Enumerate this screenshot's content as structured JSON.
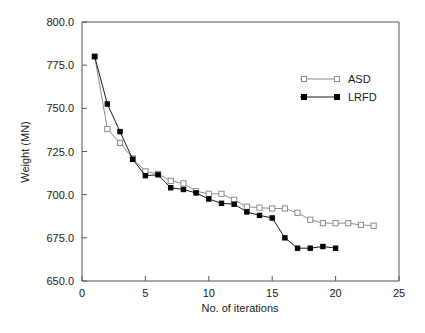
{
  "chart_data": {
    "type": "line",
    "title": "",
    "xlabel": "No. of iterations",
    "ylabel": "Weight (MN)",
    "xlim": [
      0,
      25
    ],
    "ylim": [
      650.0,
      800.0
    ],
    "xticks": [
      "0",
      "5",
      "10",
      "15",
      "20",
      "25"
    ],
    "xtick_values": [
      0,
      5,
      10,
      15,
      20,
      25
    ],
    "yticks": [
      "650.0",
      "675.0",
      "700.0",
      "725.0",
      "750.0",
      "775.0",
      "800.0"
    ],
    "ytick_values": [
      650.0,
      675.0,
      700.0,
      725.0,
      750.0,
      775.0,
      800.0
    ],
    "grid": false,
    "legend_position": "top-right",
    "series": [
      {
        "name": "ASD",
        "marker": "open-square",
        "color": "#8c8c8c",
        "x": [
          1,
          2,
          3,
          4,
          5,
          6,
          7,
          8,
          9,
          10,
          11,
          12,
          13,
          14,
          15,
          16,
          17,
          18,
          19,
          20,
          21,
          22,
          23
        ],
        "values": [
          780.0,
          738.0,
          730.0,
          721.0,
          713.5,
          712.0,
          708.0,
          706.5,
          702.0,
          700.5,
          700.5,
          697.0,
          693.0,
          692.5,
          692.0,
          692.0,
          689.5,
          685.5,
          683.5,
          683.5,
          683.5,
          682.5,
          682.0
        ]
      },
      {
        "name": "LRFD",
        "marker": "filled-square",
        "color": "#000000",
        "x": [
          1,
          2,
          3,
          4,
          5,
          6,
          7,
          8,
          9,
          10,
          11,
          12,
          13,
          14,
          15,
          16,
          17,
          18,
          19,
          20
        ],
        "values": [
          780.0,
          752.5,
          736.5,
          720.5,
          711.0,
          711.5,
          704.0,
          703.0,
          701.0,
          697.5,
          695.0,
          694.5,
          690.0,
          688.0,
          686.5,
          675.0,
          669.0,
          669.0,
          670.0,
          669.0
        ]
      }
    ]
  },
  "legend": {
    "items": [
      {
        "label": "ASD"
      },
      {
        "label": "LRFD"
      }
    ]
  }
}
